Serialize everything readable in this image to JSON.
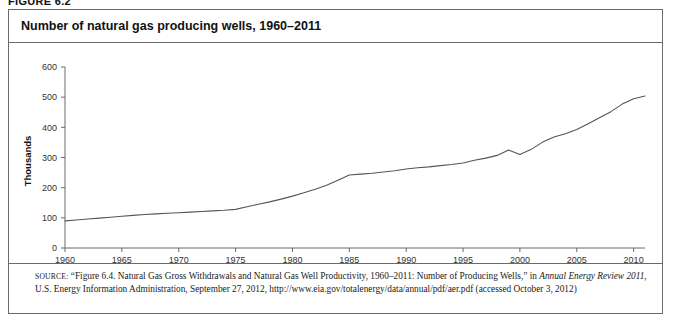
{
  "figure": {
    "number_label": "FIGURE 6.2",
    "title": "Number of natural gas producing wells, 1960–2011"
  },
  "source_note": {
    "label": "SOURCE:",
    "part1": " “Figure 6.4. Natural Gas Gross Withdrawals and Natural Gas Well Productivity, 1960–2011: Number of Producing Wells,” in ",
    "italic1": "Annual Energy Review 2011",
    "part2": ", U.S. Energy Information Administration, September 27, 2012, http://www.eia.gov/totalenergy/data/annual/pdf/aer.pdf (accessed October 3, 2012)"
  },
  "chart_data": {
    "type": "line",
    "title": "Number of natural gas producing wells, 1960–2011",
    "xlabel": "",
    "ylabel": "Thousands",
    "xlim": [
      1960,
      2011
    ],
    "ylim": [
      0,
      600
    ],
    "xticks": [
      "1960",
      "1965",
      "1970",
      "1975",
      "1980",
      "1985",
      "1990",
      "1995",
      "2000",
      "2005",
      "2010"
    ],
    "yticks": [
      "0",
      "100",
      "200",
      "300",
      "400",
      "500",
      "600"
    ],
    "grid": false,
    "legend": "none",
    "line_color": "#555555",
    "series": [
      {
        "name": "Number of producing wells",
        "x": [
          1960,
          1961,
          1962,
          1963,
          1964,
          1965,
          1966,
          1967,
          1968,
          1969,
          1970,
          1971,
          1972,
          1973,
          1974,
          1975,
          1976,
          1977,
          1978,
          1979,
          1980,
          1981,
          1982,
          1983,
          1984,
          1985,
          1986,
          1987,
          1988,
          1989,
          1990,
          1991,
          1992,
          1993,
          1994,
          1995,
          1996,
          1997,
          1998,
          1999,
          2000,
          2001,
          2002,
          2003,
          2004,
          2005,
          2006,
          2007,
          2008,
          2009,
          2010,
          2011
        ],
        "values": [
          90,
          93,
          96,
          99,
          102,
          105,
          108,
          111,
          113,
          115,
          117,
          119,
          121,
          123,
          125,
          128,
          137,
          145,
          153,
          162,
          172,
          183,
          195,
          208,
          225,
          242,
          245,
          248,
          252,
          256,
          262,
          266,
          269,
          273,
          277,
          282,
          291,
          298,
          307,
          325,
          310,
          327,
          351,
          368,
          379,
          393,
          412,
          432,
          452,
          477,
          495,
          504
        ]
      }
    ]
  }
}
